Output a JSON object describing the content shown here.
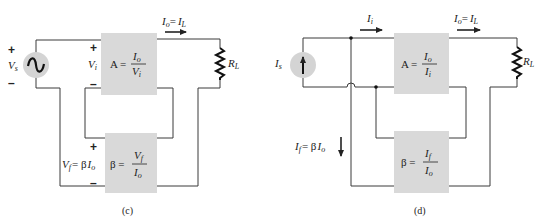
{
  "panels": [
    {
      "caption": "(c)",
      "source": {
        "type": "voltage-source",
        "label": "V",
        "label_sub": "s",
        "plus": "+",
        "minus": "–"
      },
      "amplifier": {
        "lhs": "A =",
        "num": "I",
        "num_sub": "o",
        "den": "V",
        "den_sub": "i"
      },
      "input_label": {
        "main": "V",
        "sub": "i",
        "plus": "+",
        "minus": "–"
      },
      "output_current": {
        "lhs": "I",
        "lhs_sub": "o",
        "eq": "=",
        "rhs": "I",
        "rhs_sub": "L"
      },
      "load": {
        "label": "R",
        "label_sub": "L"
      },
      "feedback": {
        "lhs": "β =",
        "num": "V",
        "num_sub": "f",
        "den": "I",
        "den_sub": "o"
      },
      "feedback_label": {
        "main": "V",
        "sub": "f",
        "eq": "= β",
        "rhs": "I",
        "rhs_sub": "o",
        "plus": "+",
        "minus": "–"
      }
    },
    {
      "caption": "(d)",
      "source": {
        "type": "current-source",
        "label": "I",
        "label_sub": "s"
      },
      "input_current": {
        "main": "I",
        "sub": "i"
      },
      "amplifier": {
        "lhs": "A =",
        "num": "I",
        "num_sub": "o",
        "den": "I",
        "den_sub": "i"
      },
      "output_current": {
        "lhs": "I",
        "lhs_sub": "o",
        "eq": "=",
        "rhs": "I",
        "rhs_sub": "L"
      },
      "load": {
        "label": "R",
        "label_sub": "L"
      },
      "feedback": {
        "lhs": "β =",
        "num": "I",
        "num_sub": "f",
        "den": "I",
        "den_sub": "o"
      },
      "feedback_current": {
        "main": "I",
        "sub": "f",
        "eq": "= β",
        "rhs": "I",
        "rhs_sub": "o"
      }
    }
  ],
  "colors": {
    "block_fill": "#d9d9d9",
    "source_fill": "#d4d4d4",
    "wire": "#3a3a3a",
    "text": "#222222"
  }
}
